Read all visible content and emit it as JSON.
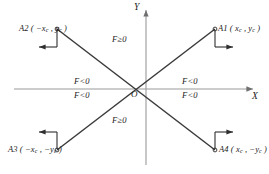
{
  "figure": {
    "axes": {
      "y_label": "Y",
      "x_label": "X",
      "origin_label": "O"
    },
    "corner_points": [
      {
        "key": "A1",
        "label": "A1 ( x",
        "sub1": "c",
        "mid": " , y",
        "sub2": "c",
        "close": " )",
        "text": "A1 ( xc , yc )"
      },
      {
        "key": "A2",
        "label": "A2 ( −x",
        "sub1": "c",
        "mid": " , y",
        "sub2": "c",
        "close": " )",
        "text": "A2 ( −xc , yc )"
      },
      {
        "key": "A3",
        "label": "A3 ( −x",
        "sub1": "c",
        "mid": " , −y",
        "sub2": "c",
        "close": " )",
        "text": "A3 ( −xc , −yc )"
      },
      {
        "key": "A4",
        "label": "A4 ( x",
        "sub1": "c",
        "mid": " , −y",
        "sub2": "c",
        "close": " )",
        "text": "A4 ( xc , −yc )"
      }
    ],
    "region_labels": {
      "top": "F≥0",
      "bottom": "F≥0",
      "left_upper": "F<0",
      "left_lower": "F<0",
      "right_upper": "F<0",
      "right_lower": "F<0"
    },
    "colors": {
      "ink": "#1a1a1a",
      "axis": "#8e8e8e",
      "diagonal": "#3c3c3c",
      "background": "#ffffff"
    }
  }
}
